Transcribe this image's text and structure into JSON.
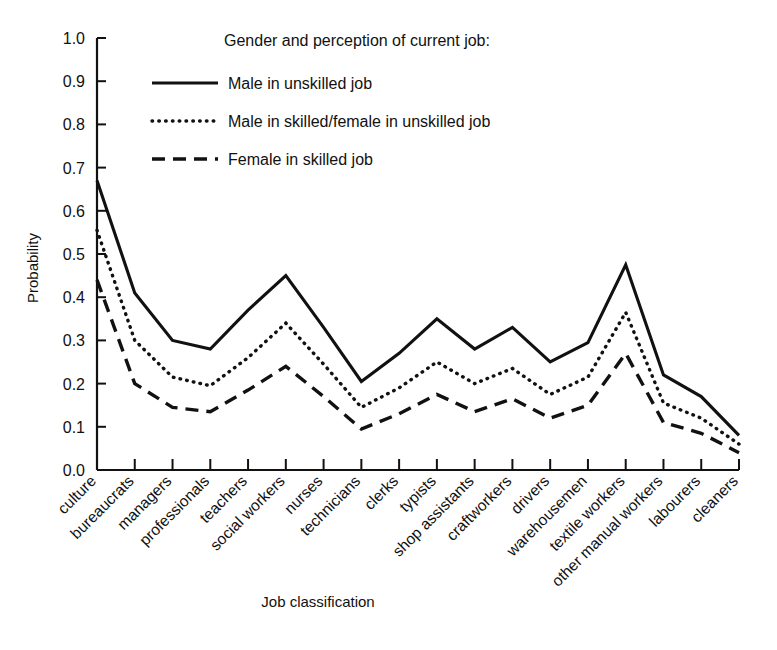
{
  "chart_data": {
    "type": "line",
    "title": "",
    "xlabel": "Job classification",
    "ylabel": "Probability",
    "ylim": [
      0.0,
      1.0
    ],
    "ytick_labels": [
      "0.0",
      "0.1",
      "0.2",
      "0.3",
      "0.4",
      "0.5",
      "0.6",
      "0.7",
      "0.8",
      "0.9",
      "1.0"
    ],
    "ytick_values": [
      0.0,
      0.1,
      0.2,
      0.3,
      0.4,
      0.5,
      0.6,
      0.7,
      0.8,
      0.9,
      1.0
    ],
    "grid": false,
    "legend_position": "top-right-inside",
    "legend_title": "Gender and perception of current job:",
    "categories": [
      "culture",
      "bureaucrats",
      "managers",
      "professionals",
      "teachers",
      "social workers",
      "nurses",
      "technicians",
      "clerks",
      "typists",
      "shop assistants",
      "craftworkers",
      "drivers",
      "warehousemen",
      "textile workers",
      "other manual workers",
      "labourers",
      "cleaners"
    ],
    "series": [
      {
        "name": "Male in unskilled job",
        "style": "solid",
        "values": [
          0.67,
          0.41,
          0.3,
          0.28,
          0.37,
          0.45,
          0.33,
          0.205,
          0.27,
          0.35,
          0.28,
          0.33,
          0.25,
          0.295,
          0.475,
          0.22,
          0.17,
          0.08
        ]
      },
      {
        "name": "Male in skilled/female in unskilled job",
        "style": "dotted",
        "values": [
          0.555,
          0.3,
          0.215,
          0.195,
          0.26,
          0.34,
          0.245,
          0.145,
          0.19,
          0.25,
          0.2,
          0.235,
          0.175,
          0.215,
          0.365,
          0.155,
          0.12,
          0.06
        ]
      },
      {
        "name": "Female in skilled job",
        "style": "dashed",
        "values": [
          0.44,
          0.2,
          0.145,
          0.135,
          0.185,
          0.24,
          0.17,
          0.095,
          0.13,
          0.175,
          0.135,
          0.165,
          0.12,
          0.15,
          0.27,
          0.11,
          0.085,
          0.04
        ]
      }
    ]
  },
  "colors": {
    "ink": "#111111",
    "background": "#ffffff"
  }
}
